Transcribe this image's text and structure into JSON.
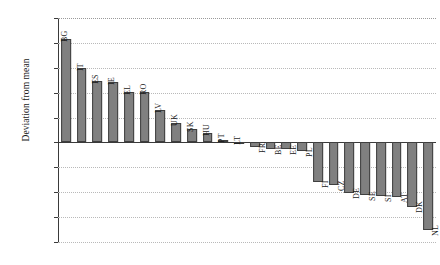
{
  "chart_data": {
    "type": "bar",
    "title": "",
    "xlabel": "",
    "ylabel": "Deviation from mean",
    "ylim": [
      -2.0,
      2.5
    ],
    "ytick_labels": [
      "2.50",
      "2.00",
      "1.50",
      "1.00",
      "0.50",
      "0.00",
      "-0.50",
      "-1.00",
      "-1.50",
      "-2.00"
    ],
    "ytick_values": [
      2.5,
      2.0,
      1.5,
      1.0,
      0.5,
      0.0,
      -0.5,
      -1.0,
      -1.5,
      -2.0
    ],
    "grid": true,
    "legend": "none",
    "bar_color": "#808080",
    "bar_edge_color": "#3f3f3f",
    "axis_color": "#3a3a3a",
    "grid_color": "#b9b9b9",
    "categories": [
      "BG",
      "IT",
      "ES",
      "IE",
      "EL",
      "RO",
      "LV",
      "UK",
      "SK",
      "HU",
      "PT",
      "LT",
      "FR",
      "BE",
      "EE",
      "PL",
      "FI",
      "CZ",
      "DE",
      "SE",
      "SI",
      "AT",
      "DK",
      "NL"
    ],
    "values": [
      2.07,
      1.5,
      1.24,
      1.22,
      1.01,
      1.01,
      0.66,
      0.39,
      0.28,
      0.18,
      0.05,
      0.01,
      -0.1,
      -0.13,
      -0.14,
      -0.17,
      -0.8,
      -0.85,
      -1.02,
      -1.05,
      -1.08,
      -1.1,
      -1.3,
      -1.75
    ]
  }
}
